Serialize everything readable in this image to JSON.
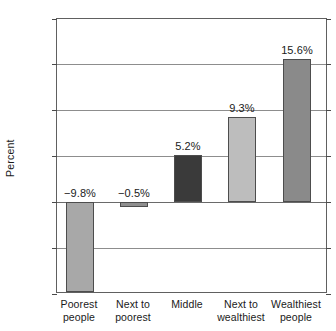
{
  "chart_data": {
    "type": "bar",
    "title": "",
    "subtitle": "",
    "xlabel": "",
    "ylabel": "Percent",
    "categories": [
      "Poorest\npeople",
      "Next to\npoorest",
      "Middle",
      "Next to\nwealthiest",
      "Wealthiest\npeople"
    ],
    "values": [
      -9.8,
      -0.5,
      5.2,
      9.3,
      15.6
    ],
    "data_labels": [
      "−9.8%",
      "−0.5%",
      "5.2%",
      "9.3%",
      "15.6%"
    ],
    "bar_colors": [
      "#a8a8a8",
      "#8f8f8f",
      "#3a3a3a",
      "#bdbdbd",
      "#8a8a8a"
    ],
    "ylim": [
      -10,
      20
    ],
    "yticks": [
      20,
      15,
      10,
      5,
      0,
      -5,
      -10
    ],
    "ytick_labels": [
      "20",
      "15",
      "10",
      "5",
      "0",
      "−5",
      "−10"
    ],
    "gridlines": [
      15,
      10,
      5,
      0,
      -5
    ],
    "grid": true,
    "legend": "none",
    "zero_line": 0
  },
  "axis": {
    "y_title": "Percent"
  }
}
